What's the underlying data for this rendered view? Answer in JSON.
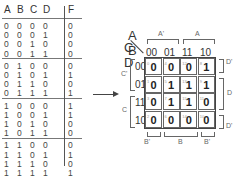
{
  "truth_table": {
    "headers": [
      "A",
      "B",
      "C",
      "D",
      "F"
    ],
    "rows": [
      [
        "0",
        "0",
        "0",
        "0",
        "0"
      ],
      [
        "0",
        "0",
        "0",
        "1",
        "0"
      ],
      [
        "0",
        "0",
        "1",
        "0",
        "0"
      ],
      [
        "0",
        "0",
        "1",
        "1",
        "0"
      ],
      [
        "0",
        "1",
        "0",
        "0",
        "0"
      ],
      [
        "0",
        "1",
        "0",
        "1",
        "1"
      ],
      [
        "0",
        "1",
        "1",
        "0",
        "0"
      ],
      [
        "0",
        "1",
        "1",
        "1",
        "1"
      ],
      [
        "1",
        "0",
        "0",
        "0",
        "1"
      ],
      [
        "1",
        "0",
        "0",
        "1",
        "1"
      ],
      [
        "1",
        "0",
        "1",
        "0",
        "0"
      ],
      [
        "1",
        "0",
        "1",
        "1",
        "0"
      ],
      [
        "1",
        "1",
        "0",
        "0",
        "0"
      ],
      [
        "1",
        "1",
        "0",
        "1",
        "1"
      ],
      [
        "1",
        "1",
        "1",
        "0",
        "0"
      ],
      [
        "1",
        "1",
        "1",
        "1",
        "1"
      ]
    ]
  },
  "arrow_icon": "right-arrow",
  "kmap": {
    "corner_top": "A B",
    "corner_left": "C D",
    "col_headers": [
      "00",
      "01",
      "11",
      "10"
    ],
    "row_headers": [
      "00",
      "01",
      "11",
      "10"
    ],
    "top_groups": [
      {
        "label": "A'"
      },
      {
        "label": "A"
      }
    ],
    "bottom_groups": [
      {
        "label": "B'"
      },
      {
        "label": "B"
      },
      {
        "label": "B'"
      }
    ],
    "left_groups": [
      {
        "label": "C'"
      },
      {
        "label": "C"
      }
    ],
    "right_groups": [
      {
        "label": "D'"
      },
      {
        "label": "D"
      },
      {
        "label": "D'"
      }
    ],
    "cells": [
      [
        {
          "v": "0",
          "i": "0"
        },
        {
          "v": "0",
          "i": "4"
        },
        {
          "v": "0",
          "i": "12"
        },
        {
          "v": "1",
          "i": "8"
        }
      ],
      [
        {
          "v": "0",
          "i": "1"
        },
        {
          "v": "1",
          "i": "5"
        },
        {
          "v": "1",
          "i": "13"
        },
        {
          "v": "1",
          "i": "9"
        }
      ],
      [
        {
          "v": "0",
          "i": "3"
        },
        {
          "v": "1",
          "i": "7"
        },
        {
          "v": "1",
          "i": "15"
        },
        {
          "v": "0",
          "i": "11"
        }
      ],
      [
        {
          "v": "0",
          "i": "2"
        },
        {
          "v": "0",
          "i": "6"
        },
        {
          "v": "0",
          "i": "14"
        },
        {
          "v": "0",
          "i": "10"
        }
      ]
    ]
  }
}
